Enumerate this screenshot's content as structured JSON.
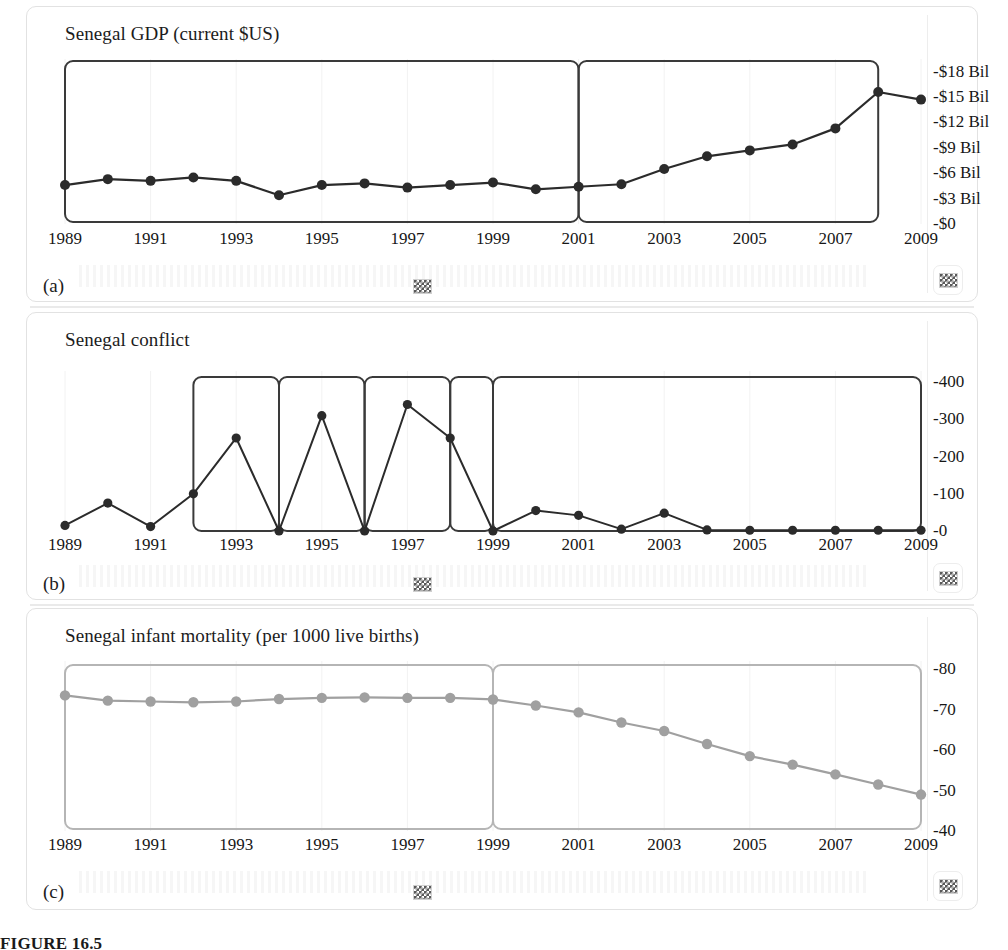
{
  "figure": {
    "caption": "FIGURE 16.5",
    "panels": [
      "(a)",
      "(b)",
      "(c)"
    ]
  },
  "icons": {
    "checker": "checkerboard-icon"
  },
  "chart_data": [
    {
      "id": "a",
      "type": "line",
      "title": "Senegal GDP (current $US)",
      "panel_label": "(a)",
      "xlabel": "",
      "ylabel": "",
      "xlim": [
        1989,
        2009
      ],
      "ylim": [
        0,
        19.5
      ],
      "grid": false,
      "legend": null,
      "series_color": "#2b2b2b",
      "x": [
        1989,
        1990,
        1991,
        1992,
        1993,
        1994,
        1995,
        1996,
        1997,
        1998,
        1999,
        2000,
        2001,
        2002,
        2003,
        2004,
        2005,
        2006,
        2007,
        2008,
        2009
      ],
      "values": [
        4.6,
        5.3,
        5.1,
        5.5,
        5.1,
        3.4,
        4.6,
        4.8,
        4.3,
        4.6,
        4.9,
        4.1,
        4.4,
        4.7,
        6.5,
        8.0,
        8.7,
        9.4,
        11.3,
        15.6,
        14.7
      ],
      "categories": [
        "1989",
        "1990",
        "1991",
        "1992",
        "1993",
        "1994",
        "1995",
        "1996",
        "1997",
        "1998",
        "1999",
        "2000",
        "2001",
        "2002",
        "2003",
        "2004",
        "2005",
        "2006",
        "2007",
        "2008",
        "2009"
      ],
      "ytick_values": [
        0,
        3,
        6,
        9,
        12,
        15,
        18
      ],
      "ytick_labels": [
        "-$0",
        "-$3 Bil",
        "-$6 Bil",
        "-$9 Bil",
        "-$12 Bil",
        "-$15 Bil",
        "-$18 Bil"
      ],
      "xtick_values": [
        1989,
        1991,
        1993,
        1995,
        1997,
        1999,
        2001,
        2003,
        2005,
        2007,
        2009
      ],
      "xtick_labels": [
        "1989",
        "1991",
        "1993",
        "1995",
        "1997",
        "1999",
        "2001",
        "2003",
        "2005",
        "2007",
        "2009"
      ],
      "highlight_boxes": [
        {
          "x0": 1989,
          "x1": 2001
        },
        {
          "x0": 2001,
          "x1": 2008
        }
      ]
    },
    {
      "id": "b",
      "type": "line",
      "title": "Senegal conflict",
      "panel_label": "(b)",
      "xlabel": "",
      "ylabel": "",
      "xlim": [
        1989,
        2009
      ],
      "ylim": [
        0,
        430
      ],
      "grid": false,
      "legend": null,
      "series_color": "#2b2b2b",
      "x": [
        1989,
        1990,
        1991,
        1992,
        1993,
        1994,
        1995,
        1996,
        1997,
        1998,
        1999,
        2000,
        2001,
        2002,
        2003,
        2004,
        2005,
        2006,
        2007,
        2008,
        2009
      ],
      "values": [
        15,
        75,
        12,
        100,
        250,
        0,
        310,
        0,
        340,
        250,
        0,
        55,
        42,
        5,
        48,
        3,
        2,
        2,
        2,
        2,
        2
      ],
      "categories": [
        "1989",
        "1990",
        "1991",
        "1992",
        "1993",
        "1994",
        "1995",
        "1996",
        "1997",
        "1998",
        "1999",
        "2000",
        "2001",
        "2002",
        "2003",
        "2004",
        "2005",
        "2006",
        "2007",
        "2008",
        "2009"
      ],
      "ytick_values": [
        0,
        100,
        200,
        300,
        400
      ],
      "ytick_labels": [
        "-0",
        "-100",
        "-200",
        "-300",
        "-400"
      ],
      "xtick_values": [
        1989,
        1991,
        1993,
        1995,
        1997,
        1999,
        2001,
        2003,
        2005,
        2007,
        2009
      ],
      "xtick_labels": [
        "1989",
        "1991",
        "1993",
        "1995",
        "1997",
        "1999",
        "2001",
        "2003",
        "2005",
        "2007",
        "2009"
      ],
      "highlight_boxes": [
        {
          "x0": 1992,
          "x1": 1994
        },
        {
          "x0": 1994,
          "x1": 1996
        },
        {
          "x0": 1996,
          "x1": 1998
        },
        {
          "x0": 1998,
          "x1": 1999
        },
        {
          "x0": 1999,
          "x1": 2009
        }
      ]
    },
    {
      "id": "c",
      "type": "line",
      "title": "Senegal infant mortality (per 1000 live births)",
      "panel_label": "(c)",
      "xlabel": "",
      "ylabel": "",
      "xlim": [
        1989,
        2009
      ],
      "ylim": [
        40,
        82
      ],
      "grid": false,
      "legend": null,
      "series_color": "#a0a0a0",
      "x": [
        1989,
        1990,
        1991,
        1992,
        1993,
        1994,
        1995,
        1996,
        1997,
        1998,
        1999,
        2000,
        2001,
        2002,
        2003,
        2004,
        2005,
        2006,
        2007,
        2008,
        2009
      ],
      "values": [
        73.5,
        72.2,
        72.0,
        71.8,
        72.0,
        72.6,
        72.9,
        73.0,
        72.9,
        72.9,
        72.5,
        71.0,
        69.3,
        66.8,
        64.7,
        61.5,
        58.5,
        56.4,
        54.0,
        51.5,
        49.0
      ],
      "categories": [
        "1989",
        "1990",
        "1991",
        "1992",
        "1993",
        "1994",
        "1995",
        "1996",
        "1997",
        "1998",
        "1999",
        "2000",
        "2001",
        "2002",
        "2003",
        "2004",
        "2005",
        "2006",
        "2007",
        "2008",
        "2009"
      ],
      "ytick_values": [
        40,
        50,
        60,
        70,
        80
      ],
      "ytick_labels": [
        "-40",
        "-50",
        "-60",
        "-70",
        "-80"
      ],
      "xtick_values": [
        1989,
        1991,
        1993,
        1995,
        1997,
        1999,
        2001,
        2003,
        2005,
        2007,
        2009
      ],
      "xtick_labels": [
        "1989",
        "1991",
        "1993",
        "1995",
        "1997",
        "1999",
        "2001",
        "2003",
        "2005",
        "2007",
        "2009"
      ],
      "highlight_boxes": [
        {
          "x0": 1989,
          "x1": 1999
        },
        {
          "x0": 1999,
          "x1": 2009
        }
      ]
    }
  ]
}
